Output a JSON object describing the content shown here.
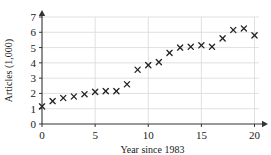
{
  "chart_data": {
    "type": "scatter",
    "title": "",
    "xlabel": "Year since 1983",
    "ylabel": "Articles (1,000)",
    "xlim": [
      0,
      20.8
    ],
    "ylim": [
      0,
      7
    ],
    "xticks": [
      0,
      5,
      10,
      15,
      20
    ],
    "xtick_labels": [
      "0",
      "5",
      "10",
      "15",
      "20"
    ],
    "yticks": [
      0,
      1,
      2,
      3,
      4,
      5,
      6,
      7
    ],
    "ytick_labels": [
      "0",
      "1",
      "2",
      "3",
      "4",
      "5",
      "6",
      "7"
    ],
    "grid": "horizontal-and-vertical-major",
    "legend": "none",
    "marker": "x",
    "marker_color": "#222222",
    "x": [
      0,
      1,
      2,
      3,
      4,
      5,
      6,
      7,
      8,
      9,
      10,
      11,
      12,
      13,
      14,
      15,
      16,
      17,
      18,
      19,
      20
    ],
    "values": [
      1.15,
      1.5,
      1.7,
      1.8,
      1.95,
      2.1,
      2.15,
      2.15,
      2.6,
      3.55,
      3.85,
      4.05,
      4.65,
      5.0,
      5.05,
      5.15,
      5.05,
      5.6,
      6.15,
      6.25,
      5.8
    ],
    "series": [
      {
        "name": "Articles",
        "values": [
          1.15,
          1.5,
          1.7,
          1.8,
          1.95,
          2.1,
          2.15,
          2.15,
          2.6,
          3.55,
          3.85,
          4.05,
          4.65,
          5.0,
          5.05,
          5.15,
          5.05,
          5.6,
          6.15,
          6.25,
          5.8
        ]
      }
    ]
  },
  "axes": {
    "x_title": "Year since 1983",
    "y_title": "Articles (1,000)"
  },
  "colors": {
    "marker": "#222222",
    "axis": "#333333",
    "grid": "#d8d8d8",
    "background": "#ffffff"
  }
}
